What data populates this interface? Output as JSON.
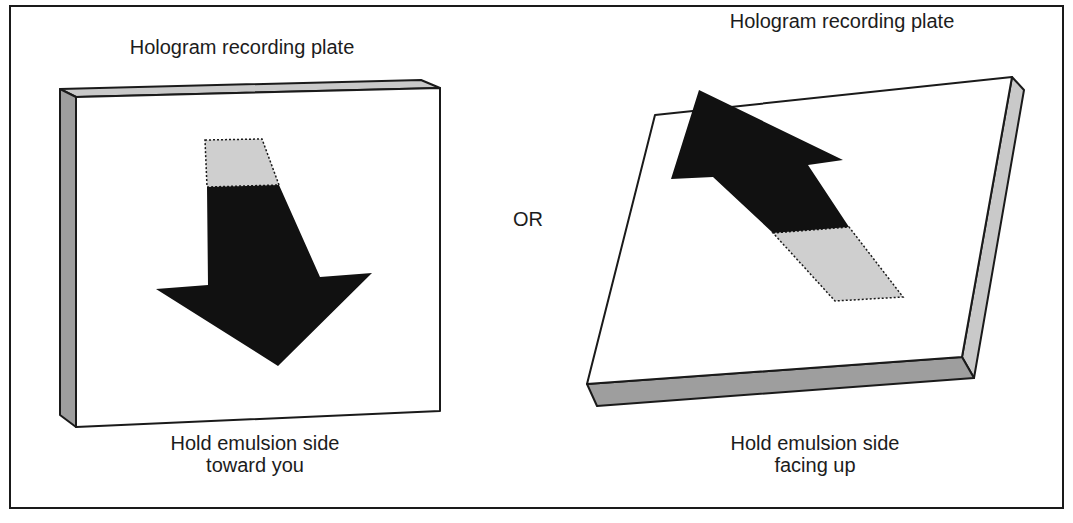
{
  "figure": {
    "type": "instruction-diagram"
  },
  "left_panel": {
    "title": "Hologram recording plate",
    "caption_line1": "Hold emulsion side",
    "caption_line2": "toward you",
    "plate_orientation": "upright",
    "arrow_direction": "down"
  },
  "separator": {
    "text": "OR"
  },
  "right_panel": {
    "title": "Hologram recording plate",
    "caption_line1": "Hold emulsion side",
    "caption_line2": "facing up",
    "plate_orientation": "flat",
    "arrow_direction": "up"
  },
  "colors": {
    "outline": "#1a1a1a",
    "plate_face": "#ffffff",
    "plate_edge_light": "#c9c9c9",
    "plate_edge_dark": "#9e9e9e",
    "arrow_fill": "#111111",
    "arrow_tail": "#cfcfcf"
  }
}
